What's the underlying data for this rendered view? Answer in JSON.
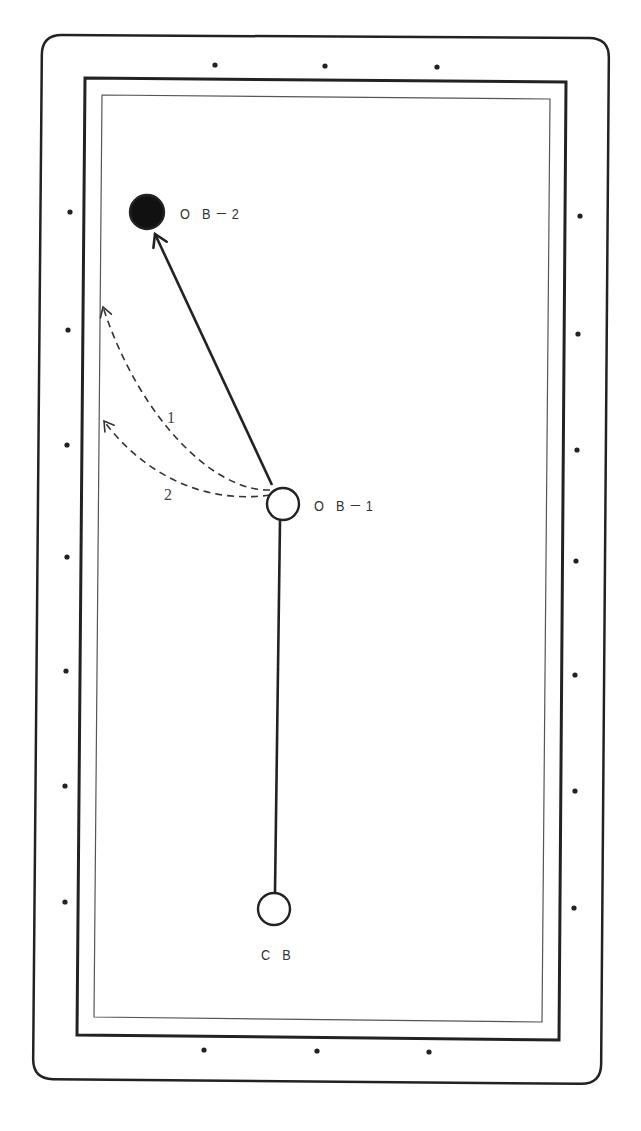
{
  "diagram": {
    "colors": {
      "line": "#222222",
      "rail_inner": "#555555",
      "ball_filled": "#111111",
      "ball_empty": "#ffffff",
      "background": "#ffffff"
    },
    "table": {
      "outer_rail": {
        "points": [
          [
            42,
            35
          ],
          [
            609,
            38
          ],
          [
            601,
            1084
          ],
          [
            33,
            1079
          ]
        ],
        "corner_radius": 20
      },
      "cushion": {
        "points": [
          [
            85,
            78
          ],
          [
            566,
            82
          ],
          [
            559,
            1040
          ],
          [
            77,
            1035
          ]
        ]
      },
      "playfield": {
        "points": [
          [
            102,
            95
          ],
          [
            550,
            99
          ],
          [
            542,
            1022
          ],
          [
            94,
            1017
          ]
        ]
      }
    },
    "diamonds": {
      "top": [
        [
          215,
          65
        ],
        [
          325,
          66
        ],
        [
          437,
          67
        ]
      ],
      "bottom": [
        [
          204,
          1050
        ],
        [
          317,
          1051
        ],
        [
          429,
          1052
        ]
      ],
      "left": [
        [
          70,
          212
        ],
        [
          68,
          330
        ],
        [
          67,
          445
        ],
        [
          67,
          557
        ],
        [
          66,
          671
        ],
        [
          65,
          786
        ],
        [
          65,
          902
        ]
      ],
      "right": [
        [
          580,
          216
        ],
        [
          578,
          334
        ],
        [
          577,
          450
        ],
        [
          576,
          561
        ],
        [
          575,
          675
        ],
        [
          575,
          791
        ],
        [
          574,
          908
        ]
      ]
    },
    "balls": [
      {
        "id": "OB-2",
        "label": "O B－2",
        "cx": 147,
        "cy": 212,
        "r": 17,
        "filled": true,
        "label_x": 180,
        "label_y": 206
      },
      {
        "id": "OB-1",
        "label": "O B－1",
        "cx": 283,
        "cy": 504,
        "r": 16,
        "filled": false,
        "label_x": 314,
        "label_y": 498
      },
      {
        "id": "CB",
        "label": "C B",
        "cx": 274,
        "cy": 909,
        "r": 16,
        "filled": false,
        "label_x": 261,
        "label_y": 947
      }
    ],
    "paths": [
      {
        "id": "cue-to-ob1",
        "type": "solid",
        "from": [
          275,
          892
        ],
        "to": [
          280,
          521
        ],
        "arrow": false
      },
      {
        "id": "ob1-to-ob2",
        "type": "solid",
        "from": [
          272,
          485
        ],
        "to": [
          155,
          234
        ],
        "arrow": true
      }
    ],
    "dashed_paths": [
      {
        "id": "path-1",
        "label": "1",
        "d": "M 270 490 C 215 492, 140 420, 103 307",
        "tip": [
          103,
          307
        ],
        "label_x": 167,
        "label_y": 410
      },
      {
        "id": "path-2",
        "label": "2",
        "d": "M 270 495 C 200 505, 140 470, 104 421",
        "tip": [
          104,
          421
        ],
        "label_x": 164,
        "label_y": 487
      }
    ]
  }
}
